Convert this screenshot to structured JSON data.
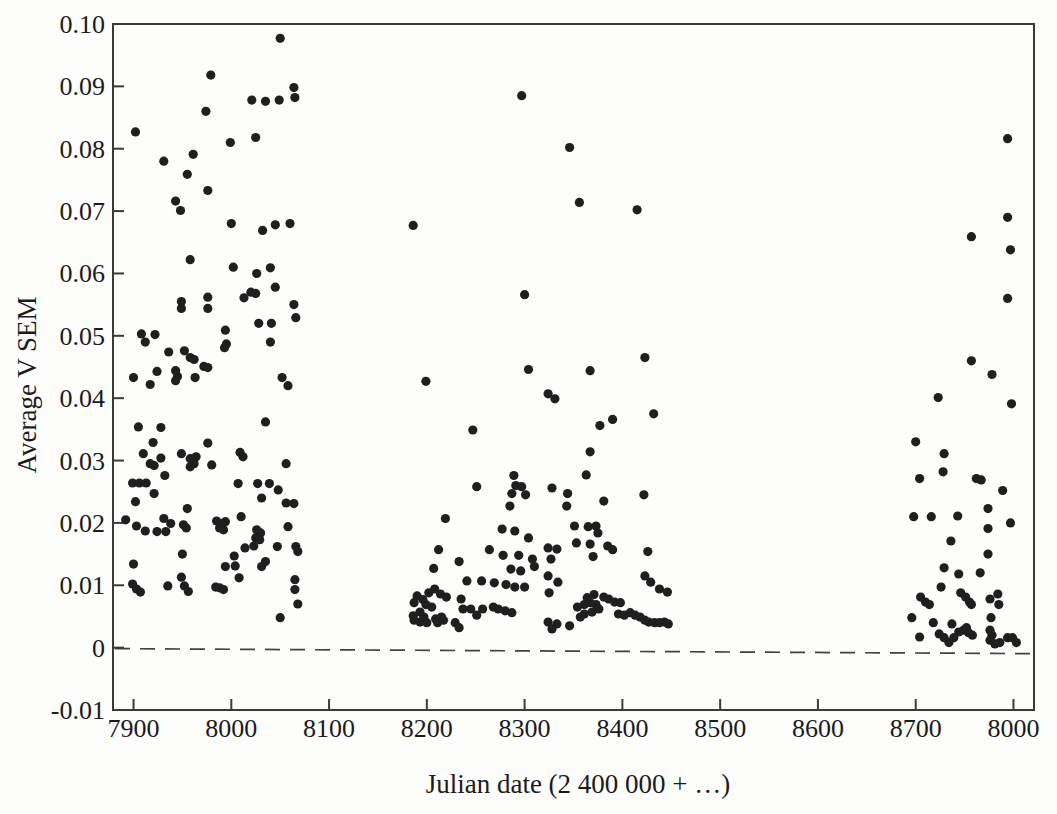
{
  "figure": {
    "colors": {
      "background": "#fdfdfb",
      "dot": "#1f1f1f",
      "axis": "#3a3a3a",
      "text": "#1b1b1b",
      "zero_line": "#424242"
    }
  },
  "chart_data": {
    "type": "scatter",
    "title": "",
    "xlabel": "Julian date (2 400 000 + …)",
    "ylabel": "Average V SEM",
    "xlim": [
      7879,
      8821
    ],
    "ylim": [
      -0.01,
      0.1
    ],
    "grid": false,
    "x_ticks": [
      7900,
      8000,
      8100,
      8200,
      8300,
      8400,
      8500,
      8600,
      8700,
      8800
    ],
    "x_tick_labels": [
      "7900",
      "8000",
      "8100",
      "8200",
      "8300",
      "8400",
      "8500",
      "8600",
      "8700",
      "8000"
    ],
    "y_ticks": [
      -0.01,
      0,
      0.01,
      0.02,
      0.03,
      0.04,
      0.05,
      0.06,
      0.07,
      0.08,
      0.09,
      0.1
    ],
    "y_tick_labels": [
      "-0.01",
      "0",
      "0.01",
      "0.02",
      "0.03",
      "0.04",
      "0.05",
      "0.06",
      "0.07",
      "0.08",
      "0.09",
      "0.10"
    ],
    "marker": {
      "shape": "circle",
      "radius_px": 4.6
    },
    "zero_reference_line": {
      "y": 0,
      "style": "dashed"
    },
    "points": [
      [
        8050,
        0.0977
      ],
      [
        7979,
        0.0918
      ],
      [
        8064,
        0.0898
      ],
      [
        8065,
        0.0882
      ],
      [
        8021,
        0.0878
      ],
      [
        8035,
        0.0876
      ],
      [
        8049,
        0.0878
      ],
      [
        7974,
        0.086
      ],
      [
        7902,
        0.0827
      ],
      [
        7999,
        0.081
      ],
      [
        8025,
        0.0818
      ],
      [
        7961,
        0.0791
      ],
      [
        7931,
        0.078
      ],
      [
        7955,
        0.0759
      ],
      [
        7976,
        0.0733
      ],
      [
        7943,
        0.0716
      ],
      [
        7948,
        0.0701
      ],
      [
        8000,
        0.068
      ],
      [
        8032,
        0.0669
      ],
      [
        8045,
        0.0678
      ],
      [
        8060,
        0.068
      ],
      [
        7958,
        0.0622
      ],
      [
        8002,
        0.061
      ],
      [
        8026,
        0.06
      ],
      [
        8040,
        0.0609
      ],
      [
        8045,
        0.0578
      ],
      [
        7976,
        0.0562
      ],
      [
        8020,
        0.057
      ],
      [
        8025,
        0.0568
      ],
      [
        8013,
        0.0561
      ],
      [
        7949,
        0.0555
      ],
      [
        7949,
        0.0544
      ],
      [
        7976,
        0.0544
      ],
      [
        8064,
        0.055
      ],
      [
        8066,
        0.0529
      ],
      [
        8028,
        0.052
      ],
      [
        8041,
        0.052
      ],
      [
        7994,
        0.0509
      ],
      [
        7908,
        0.0503
      ],
      [
        7912,
        0.049
      ],
      [
        7922,
        0.0502
      ],
      [
        7995,
        0.0487
      ],
      [
        7993,
        0.0481
      ],
      [
        8040,
        0.049
      ],
      [
        7936,
        0.0474
      ],
      [
        7952,
        0.0476
      ],
      [
        7958,
        0.0465
      ],
      [
        7962,
        0.0462
      ],
      [
        7972,
        0.0451
      ],
      [
        7976,
        0.0449
      ],
      [
        7900,
        0.0433
      ],
      [
        7924,
        0.0443
      ],
      [
        7943,
        0.0444
      ],
      [
        7945,
        0.0435
      ],
      [
        7943,
        0.0428
      ],
      [
        7963,
        0.0433
      ],
      [
        7917,
        0.0422
      ],
      [
        8052,
        0.0433
      ],
      [
        8058,
        0.042
      ],
      [
        8035,
        0.0362
      ],
      [
        7905,
        0.0354
      ],
      [
        7928,
        0.0353
      ],
      [
        7920,
        0.0329
      ],
      [
        7976,
        0.0328
      ],
      [
        7910,
        0.0311
      ],
      [
        7928,
        0.0304
      ],
      [
        7917,
        0.0295
      ],
      [
        7921,
        0.0292
      ],
      [
        7949,
        0.0311
      ],
      [
        7958,
        0.0303
      ],
      [
        7964,
        0.0306
      ],
      [
        7962,
        0.0295
      ],
      [
        7958,
        0.029
      ],
      [
        7980,
        0.0293
      ],
      [
        8009,
        0.0313
      ],
      [
        8012,
        0.0306
      ],
      [
        8056,
        0.0295
      ],
      [
        7932,
        0.0276
      ],
      [
        7899,
        0.0264
      ],
      [
        7906,
        0.0264
      ],
      [
        7913,
        0.0264
      ],
      [
        8007,
        0.0263
      ],
      [
        8027,
        0.0263
      ],
      [
        8039,
        0.0263
      ],
      [
        7921,
        0.0247
      ],
      [
        8048,
        0.0253
      ],
      [
        7902,
        0.0234
      ],
      [
        8031,
        0.024
      ],
      [
        8056,
        0.0232
      ],
      [
        8064,
        0.0231
      ],
      [
        7955,
        0.0223
      ],
      [
        8010,
        0.021
      ],
      [
        7892,
        0.0205
      ],
      [
        7903,
        0.0195
      ],
      [
        7931,
        0.0207
      ],
      [
        7938,
        0.0199
      ],
      [
        7912,
        0.0187
      ],
      [
        7924,
        0.0186
      ],
      [
        7933,
        0.0186
      ],
      [
        7951,
        0.0197
      ],
      [
        7954,
        0.0192
      ],
      [
        7985,
        0.0203
      ],
      [
        7989,
        0.0199
      ],
      [
        7994,
        0.0202
      ],
      [
        7988,
        0.0192
      ],
      [
        7992,
        0.0189
      ],
      [
        8026,
        0.0189
      ],
      [
        8030,
        0.0184
      ],
      [
        8025,
        0.0176
      ],
      [
        8029,
        0.0173
      ],
      [
        8058,
        0.0194
      ],
      [
        8014,
        0.016
      ],
      [
        8023,
        0.0163
      ],
      [
        8047,
        0.0162
      ],
      [
        8066,
        0.0162
      ],
      [
        8068,
        0.0154
      ],
      [
        7950,
        0.015
      ],
      [
        8003,
        0.0147
      ],
      [
        7900,
        0.0134
      ],
      [
        7994,
        0.013
      ],
      [
        8004,
        0.0131
      ],
      [
        8031,
        0.013
      ],
      [
        8035,
        0.0138
      ],
      [
        7949,
        0.0113
      ],
      [
        8008,
        0.0112
      ],
      [
        7952,
        0.0099
      ],
      [
        7956,
        0.009
      ],
      [
        7899,
        0.0102
      ],
      [
        7903,
        0.0094
      ],
      [
        7907,
        0.0089
      ],
      [
        7935,
        0.0099
      ],
      [
        7984,
        0.0097
      ],
      [
        7988,
        0.0096
      ],
      [
        7992,
        0.0093
      ],
      [
        8065,
        0.0109
      ],
      [
        8065,
        0.0093
      ],
      [
        8068,
        0.007
      ],
      [
        8050,
        0.0048
      ],
      [
        8297,
        0.0885
      ],
      [
        8346,
        0.0802
      ],
      [
        8356,
        0.0714
      ],
      [
        8415,
        0.0702
      ],
      [
        8186,
        0.0677
      ],
      [
        8300,
        0.0566
      ],
      [
        8304,
        0.0446
      ],
      [
        8199,
        0.0427
      ],
      [
        8367,
        0.0444
      ],
      [
        8423,
        0.0465
      ],
      [
        8324,
        0.0407
      ],
      [
        8331,
        0.0399
      ],
      [
        8432,
        0.0375
      ],
      [
        8390,
        0.0366
      ],
      [
        8377,
        0.0356
      ],
      [
        8247,
        0.0349
      ],
      [
        8367,
        0.0314
      ],
      [
        8363,
        0.0277
      ],
      [
        8289,
        0.0276
      ],
      [
        8291,
        0.026
      ],
      [
        8297,
        0.0258
      ],
      [
        8251,
        0.0258
      ],
      [
        8287,
        0.0247
      ],
      [
        8301,
        0.0245
      ],
      [
        8328,
        0.0256
      ],
      [
        8344,
        0.0247
      ],
      [
        8343,
        0.0227
      ],
      [
        8285,
        0.0227
      ],
      [
        8381,
        0.0235
      ],
      [
        8422,
        0.0245
      ],
      [
        8219,
        0.0207
      ],
      [
        8277,
        0.019
      ],
      [
        8290,
        0.0187
      ],
      [
        8304,
        0.0176
      ],
      [
        8351,
        0.0195
      ],
      [
        8365,
        0.0194
      ],
      [
        8373,
        0.0195
      ],
      [
        8375,
        0.0184
      ],
      [
        8353,
        0.0168
      ],
      [
        8367,
        0.0166
      ],
      [
        8212,
        0.0157
      ],
      [
        8264,
        0.0157
      ],
      [
        8278,
        0.0148
      ],
      [
        8294,
        0.0148
      ],
      [
        8324,
        0.016
      ],
      [
        8333,
        0.0158
      ],
      [
        8327,
        0.0142
      ],
      [
        8385,
        0.0163
      ],
      [
        8390,
        0.0157
      ],
      [
        8370,
        0.0146
      ],
      [
        8426,
        0.0154
      ],
      [
        8207,
        0.0127
      ],
      [
        8233,
        0.0138
      ],
      [
        8308,
        0.0142
      ],
      [
        8310,
        0.013
      ],
      [
        8286,
        0.0126
      ],
      [
        8296,
        0.0123
      ],
      [
        8324,
        0.0115
      ],
      [
        8334,
        0.0105
      ],
      [
        8423,
        0.0115
      ],
      [
        8429,
        0.0105
      ],
      [
        8241,
        0.0107
      ],
      [
        8256,
        0.0107
      ],
      [
        8269,
        0.0104
      ],
      [
        8281,
        0.0101
      ],
      [
        8290,
        0.0097
      ],
      [
        8300,
        0.0097
      ],
      [
        8208,
        0.0094
      ],
      [
        8202,
        0.0088
      ],
      [
        8214,
        0.0086
      ],
      [
        8220,
        0.0081
      ],
      [
        8325,
        0.0088
      ],
      [
        8438,
        0.0094
      ],
      [
        8446,
        0.0089
      ],
      [
        8190,
        0.0083
      ],
      [
        8196,
        0.0077
      ],
      [
        8187,
        0.0072
      ],
      [
        8199,
        0.0069
      ],
      [
        8205,
        0.0065
      ],
      [
        8235,
        0.0078
      ],
      [
        8364,
        0.008
      ],
      [
        8371,
        0.0085
      ],
      [
        8381,
        0.0081
      ],
      [
        8386,
        0.0078
      ],
      [
        8392,
        0.0073
      ],
      [
        8398,
        0.0072
      ],
      [
        8193,
        0.0057
      ],
      [
        8186,
        0.0051
      ],
      [
        8197,
        0.0049
      ],
      [
        8209,
        0.0046
      ],
      [
        8215,
        0.0049
      ],
      [
        8237,
        0.0062
      ],
      [
        8257,
        0.0062
      ],
      [
        8251,
        0.0052
      ],
      [
        8245,
        0.0062
      ],
      [
        8268,
        0.0065
      ],
      [
        8273,
        0.0062
      ],
      [
        8280,
        0.0059
      ],
      [
        8287,
        0.0056
      ],
      [
        8354,
        0.0065
      ],
      [
        8361,
        0.0069
      ],
      [
        8367,
        0.0072
      ],
      [
        8373,
        0.0069
      ],
      [
        8376,
        0.0062
      ],
      [
        8369,
        0.0057
      ],
      [
        8361,
        0.0054
      ],
      [
        8357,
        0.0049
      ],
      [
        8396,
        0.0054
      ],
      [
        8402,
        0.0052
      ],
      [
        8408,
        0.0056
      ],
      [
        8413,
        0.0052
      ],
      [
        8418,
        0.0049
      ],
      [
        8229,
        0.004
      ],
      [
        8233,
        0.0032
      ],
      [
        8187,
        0.0044
      ],
      [
        8193,
        0.0041
      ],
      [
        8200,
        0.004
      ],
      [
        8211,
        0.004
      ],
      [
        8217,
        0.0044
      ],
      [
        8423,
        0.0044
      ],
      [
        8427,
        0.0041
      ],
      [
        8433,
        0.004
      ],
      [
        8438,
        0.004
      ],
      [
        8443,
        0.0041
      ],
      [
        8447,
        0.0038
      ],
      [
        8324,
        0.0041
      ],
      [
        8333,
        0.0038
      ],
      [
        8346,
        0.0035
      ],
      [
        8328,
        0.003
      ],
      [
        8794,
        0.0816
      ],
      [
        8794,
        0.069
      ],
      [
        8757,
        0.0659
      ],
      [
        8797,
        0.0638
      ],
      [
        8794,
        0.056
      ],
      [
        8757,
        0.046
      ],
      [
        8778,
        0.0438
      ],
      [
        8723,
        0.0401
      ],
      [
        8798,
        0.0391
      ],
      [
        8700,
        0.033
      ],
      [
        8729,
        0.0311
      ],
      [
        8728,
        0.0282
      ],
      [
        8704,
        0.0271
      ],
      [
        8762,
        0.0271
      ],
      [
        8767,
        0.0269
      ],
      [
        8789,
        0.0252
      ],
      [
        8774,
        0.0223
      ],
      [
        8698,
        0.021
      ],
      [
        8716,
        0.021
      ],
      [
        8743,
        0.0211
      ],
      [
        8797,
        0.02
      ],
      [
        8774,
        0.0191
      ],
      [
        8736,
        0.0171
      ],
      [
        8774,
        0.015
      ],
      [
        8729,
        0.0128
      ],
      [
        8744,
        0.0118
      ],
      [
        8766,
        0.012
      ],
      [
        8726,
        0.0097
      ],
      [
        8746,
        0.0088
      ],
      [
        8751,
        0.0081
      ],
      [
        8755,
        0.0073
      ],
      [
        8757,
        0.0069
      ],
      [
        8705,
        0.0081
      ],
      [
        8710,
        0.0073
      ],
      [
        8714,
        0.0069
      ],
      [
        8784,
        0.0086
      ],
      [
        8776,
        0.0078
      ],
      [
        8785,
        0.0069
      ],
      [
        8696,
        0.0048
      ],
      [
        8777,
        0.0048
      ],
      [
        8718,
        0.004
      ],
      [
        8737,
        0.0038
      ],
      [
        8752,
        0.0032
      ],
      [
        8724,
        0.0022
      ],
      [
        8729,
        0.0016
      ],
      [
        8734,
        0.0008
      ],
      [
        8739,
        0.0016
      ],
      [
        8744,
        0.0025
      ],
      [
        8749,
        0.0028
      ],
      [
        8754,
        0.0024
      ],
      [
        8758,
        0.002
      ],
      [
        8704,
        0.0017
      ],
      [
        8776,
        0.0028
      ],
      [
        8778,
        0.002
      ],
      [
        8776,
        0.0012
      ],
      [
        8781,
        0.0006
      ],
      [
        8786,
        0.0008
      ],
      [
        8794,
        0.0016
      ],
      [
        8799,
        0.0016
      ],
      [
        8803,
        0.0008
      ]
    ]
  }
}
